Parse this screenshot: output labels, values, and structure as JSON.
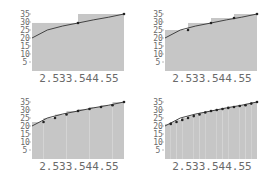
{
  "chart_data": [
    {
      "type": "bar",
      "subtype": "riemann-right-endpoint",
      "title": "",
      "n": 2,
      "xlabel": "",
      "ylabel": "",
      "xlim": [
        2,
        5
      ],
      "ylim": [
        0,
        3.5
      ],
      "x_tick_text": "2.533.544.55",
      "x_ticks": [
        2.5,
        3,
        3.5,
        4,
        4.5,
        5
      ],
      "y_tick_labels": [
        "35",
        "30",
        "25",
        "20",
        "15",
        "10",
        "5"
      ],
      "y_ticks": [
        3.5,
        3.0,
        2.5,
        2.0,
        1.5,
        1.0,
        0.5
      ],
      "curve": {
        "x": [
          2,
          2.5,
          3,
          3.5,
          4,
          4.5,
          5
        ],
        "y": [
          2.0,
          2.5,
          2.75,
          2.94,
          3.13,
          3.3,
          3.5
        ]
      },
      "sample_points": {
        "x": [
          3.5,
          5
        ],
        "y": [
          2.94,
          3.5
        ]
      },
      "rects": [
        {
          "x0": 2,
          "x1": 3.5,
          "h": 2.94
        },
        {
          "x0": 3.5,
          "x1": 5,
          "h": 3.5
        }
      ]
    },
    {
      "type": "bar",
      "subtype": "riemann-right-endpoint",
      "title": "",
      "n": 4,
      "xlabel": "",
      "ylabel": "",
      "xlim": [
        2,
        5
      ],
      "ylim": [
        0,
        3.5
      ],
      "x_tick_text": "2.533.544.55",
      "x_ticks": [
        2.5,
        3,
        3.5,
        4,
        4.5,
        5
      ],
      "y_tick_labels": [
        "35",
        "30",
        "25",
        "20",
        "15",
        "10",
        "5"
      ],
      "y_ticks": [
        3.5,
        3.0,
        2.5,
        2.0,
        1.5,
        1.0,
        0.5
      ],
      "curve": {
        "x": [
          2,
          2.5,
          3,
          3.5,
          4,
          4.5,
          5
        ],
        "y": [
          2.0,
          2.5,
          2.75,
          2.94,
          3.13,
          3.3,
          3.5
        ]
      },
      "sample_points": {
        "x": [
          2.75,
          3.5,
          4.25,
          5
        ],
        "y": [
          2.5,
          2.94,
          3.25,
          3.5
        ]
      },
      "rects": [
        {
          "x0": 2,
          "x1": 2.75,
          "h": 2.5
        },
        {
          "x0": 2.75,
          "x1": 3.5,
          "h": 2.94
        },
        {
          "x0": 3.5,
          "x1": 4.25,
          "h": 3.25
        },
        {
          "x0": 4.25,
          "x1": 5,
          "h": 3.5
        }
      ]
    },
    {
      "type": "bar",
      "subtype": "riemann-right-endpoint",
      "title": "",
      "n": 8,
      "xlabel": "",
      "ylabel": "",
      "xlim": [
        2,
        5
      ],
      "ylim": [
        0,
        3.5
      ],
      "x_tick_text": "2.533.544.55",
      "x_ticks": [
        2.5,
        3,
        3.5,
        4,
        4.5,
        5
      ],
      "y_tick_labels": [
        "35",
        "30",
        "25",
        "20",
        "15",
        "10",
        "5"
      ],
      "y_ticks": [
        3.5,
        3.0,
        2.5,
        2.0,
        1.5,
        1.0,
        0.5
      ],
      "curve": {
        "x": [
          2,
          2.5,
          3,
          3.5,
          4,
          4.5,
          5
        ],
        "y": [
          2.0,
          2.5,
          2.75,
          2.94,
          3.13,
          3.3,
          3.5
        ]
      },
      "sample_points": {
        "x": [
          2.375,
          2.75,
          3.125,
          3.5,
          3.875,
          4.25,
          4.625,
          5
        ],
        "y": [
          2.25,
          2.5,
          2.72,
          2.94,
          3.06,
          3.19,
          3.3,
          3.5
        ]
      },
      "rects": [
        {
          "x0": 2,
          "x1": 2.375,
          "h": 2.25
        },
        {
          "x0": 2.375,
          "x1": 2.75,
          "h": 2.5
        },
        {
          "x0": 2.75,
          "x1": 3.125,
          "h": 2.72
        },
        {
          "x0": 3.125,
          "x1": 3.5,
          "h": 2.94
        },
        {
          "x0": 3.5,
          "x1": 3.875,
          "h": 3.06
        },
        {
          "x0": 3.875,
          "x1": 4.25,
          "h": 3.19
        },
        {
          "x0": 4.25,
          "x1": 4.625,
          "h": 3.3
        },
        {
          "x0": 4.625,
          "x1": 5,
          "h": 3.5
        }
      ]
    },
    {
      "type": "bar",
      "subtype": "riemann-right-endpoint",
      "title": "",
      "n": 16,
      "xlabel": "",
      "ylabel": "",
      "xlim": [
        2,
        5
      ],
      "ylim": [
        0,
        3.5
      ],
      "x_tick_text": "2.533.544.55",
      "x_ticks": [
        2.5,
        3,
        3.5,
        4,
        4.5,
        5
      ],
      "y_tick_labels": [
        "35",
        "30",
        "25",
        "20",
        "15",
        "10",
        "5"
      ],
      "y_ticks": [
        3.5,
        3.0,
        2.5,
        2.0,
        1.5,
        1.0,
        0.5
      ],
      "curve": {
        "x": [
          2,
          2.5,
          3,
          3.5,
          4,
          4.5,
          5
        ],
        "y": [
          2.0,
          2.5,
          2.75,
          2.94,
          3.13,
          3.3,
          3.5
        ]
      },
      "sample_points": {
        "x": [
          2.1875,
          2.375,
          2.5625,
          2.75,
          2.9375,
          3.125,
          3.3125,
          3.5,
          3.6875,
          3.875,
          4.0625,
          4.25,
          4.4375,
          4.625,
          4.8125,
          5
        ],
        "y": [
          2.13,
          2.25,
          2.38,
          2.5,
          2.62,
          2.72,
          2.84,
          2.94,
          3.0,
          3.06,
          3.13,
          3.19,
          3.25,
          3.3,
          3.4,
          3.5
        ]
      },
      "rects": "right-endpoint rectangles of width 0.1875 at each sample point"
    }
  ],
  "style": {
    "fill_color": "#c6c6c6",
    "curve_color": "#333333",
    "point_color": "#222222",
    "tick_label_color": "#6a6a6a",
    "background": "#ffffff"
  }
}
